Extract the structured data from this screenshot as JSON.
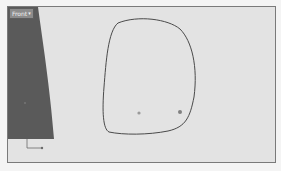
{
  "viewport": {
    "label": "Front",
    "label_arrow": "▾",
    "colors": {
      "background": "#e3e3e3",
      "frame": "#7a7a7a",
      "dark_shape": "#5a5a5a",
      "curve": "#4a4a4a"
    }
  }
}
